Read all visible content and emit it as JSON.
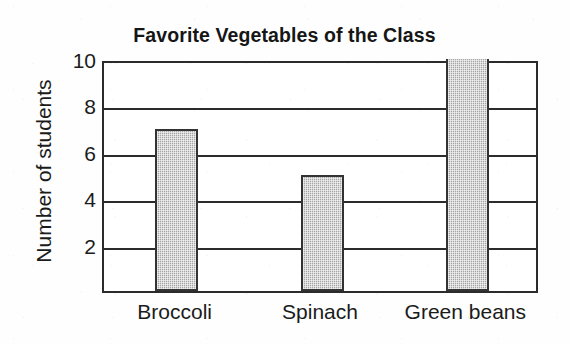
{
  "chart_data": {
    "type": "bar",
    "title": "Favorite Vegetables of the Class",
    "xlabel": "",
    "ylabel": "Number of students",
    "categories": [
      "Broccoli",
      "Spinach",
      "Green beans"
    ],
    "values": [
      7,
      5,
      10
    ],
    "ylim": [
      0,
      10
    ],
    "y_ticks": [
      2,
      4,
      6,
      8,
      10
    ],
    "y_tick_labels": [
      "2",
      "4",
      "6",
      "8",
      "10"
    ],
    "grid": true,
    "grid_axis": "y",
    "legend": false,
    "bar_fill_color": "#b9b9b9",
    "bar_edge_color": "#333333",
    "axis_color": "#2b2b2b",
    "background_color": "#ffffff"
  }
}
